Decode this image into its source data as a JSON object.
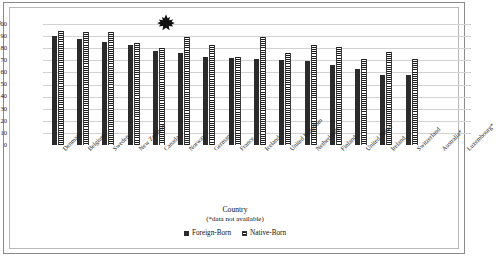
{
  "chart_data": {
    "type": "bar",
    "title": "",
    "xlabel": "Country",
    "xlabel_note": "(*data not available)",
    "ylabel": "Percentage",
    "ylim": [
      0,
      100
    ],
    "ytick_step": 10,
    "yticks": [
      "0",
      "10",
      "20",
      "30",
      "40",
      "50",
      "60",
      "70",
      "80",
      "90",
      "100"
    ],
    "grid": true,
    "legend_position": "bottom-center",
    "categories": [
      "Denmark",
      "Belgium",
      "Sweden",
      "New Zealand",
      "Canada",
      "Norway",
      "Germany",
      "France",
      "Iceland",
      "United Kingdom",
      "Netherlands",
      "Finland",
      "United States",
      "Ireland",
      "Switzerland",
      "Australia*",
      "Luxembourg*"
    ],
    "series": [
      {
        "name": "Foreign-Born",
        "values": [
          90,
          88,
          85,
          83,
          78,
          76,
          72.5,
          72,
          71,
          70.5,
          69.5,
          66,
          62.5,
          58,
          58,
          null,
          null
        ]
      },
      {
        "name": "Native-Born",
        "values": [
          94,
          93,
          93,
          84,
          80,
          89,
          83,
          72.5,
          89,
          76,
          83,
          81,
          71,
          77,
          71,
          null,
          null
        ]
      }
    ],
    "annotations": [
      {
        "name": "maple-leaf",
        "near_category": "Canada",
        "description": "Canadian maple leaf marker above the Canada bars"
      }
    ],
    "colors": {
      "foreign_born": "#2b2b2b",
      "native_born": "#1d1d1d",
      "grid": "#d2d2d2",
      "axis": "#9a9a9a",
      "background": "#ffffff"
    }
  }
}
